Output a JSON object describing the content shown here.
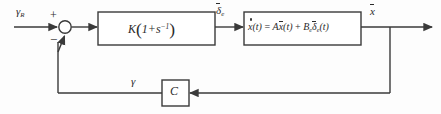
{
  "diagram": {
    "type": "control-block-diagram",
    "background_color": "#fdfdfd",
    "line_color": "#3a3a3a",
    "text_color": "#2b2b2b"
  },
  "signals": {
    "reference_input": {
      "symbol": "γ",
      "subscript": "R",
      "name": "reference-flight-path-angle"
    },
    "control_surface": {
      "symbol": "δ",
      "subscript": "e",
      "overbar": true,
      "name": "elevator-deflection"
    },
    "state_output": {
      "symbol": "x",
      "overbar": true,
      "name": "state-vector"
    },
    "feedback": {
      "symbol": "γ",
      "name": "measured-flight-path-angle"
    }
  },
  "summing_junction": {
    "name": "summing-junction",
    "plus_sign": "+",
    "minus_sign": "−"
  },
  "blocks": {
    "controller": {
      "name": "controller-block",
      "gain": "K",
      "expression_open": "(",
      "expression_body": "1+s",
      "exponent": "−1",
      "expression_close": ")",
      "full_text": "K(1+s⁻¹)"
    },
    "plant": {
      "name": "plant-state-equation-block",
      "lhs": "x",
      "lhs_arg": "(t)",
      "equals": "=",
      "term1_matrix": "A",
      "term1_state": "x",
      "term1_arg": "(t)",
      "plus": "+",
      "term2_matrix": "B",
      "term2_matrix_sub": "e",
      "term2_signal": "δ",
      "term2_signal_sub": "e",
      "term2_arg": "(t)",
      "full_text": "ẋ(t) = Ax(t) + Bₑδₑ(t)"
    },
    "sensor": {
      "name": "output-matrix-block",
      "label": "C"
    }
  }
}
